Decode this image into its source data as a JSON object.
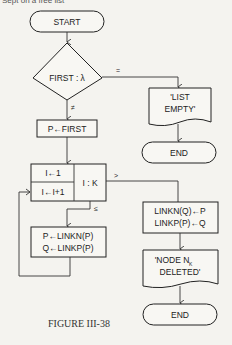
{
  "header": {
    "text": "Sept on a free list"
  },
  "flowchart": {
    "start": {
      "label": "START"
    },
    "decision_first": {
      "label": "FIRST : λ",
      "branch_equal": "=",
      "branch_not_equal": "≠"
    },
    "output_list_empty": {
      "line1": "'LIST",
      "line2": "EMPTY'"
    },
    "end_top": {
      "label": "END"
    },
    "assign_p_first": {
      "label": "P←FIRST"
    },
    "loop": {
      "init": "I←1",
      "increment": "I←I+1",
      "compare": "I : K",
      "branch_greater": ">",
      "branch_less_equal": "≤"
    },
    "advance": {
      "line1": "P←LINKN(P)",
      "line2": "Q←LINKP(P)"
    },
    "relink": {
      "line1": "LINKN(Q)←P",
      "line2": "LINKP(P)←Q"
    },
    "output_deleted": {
      "line1": "'NODE N",
      "subscript": "K",
      "line2": "DELETED'"
    },
    "end_bottom": {
      "label": "END"
    }
  },
  "caption": {
    "label": "FIGURE III-38"
  }
}
